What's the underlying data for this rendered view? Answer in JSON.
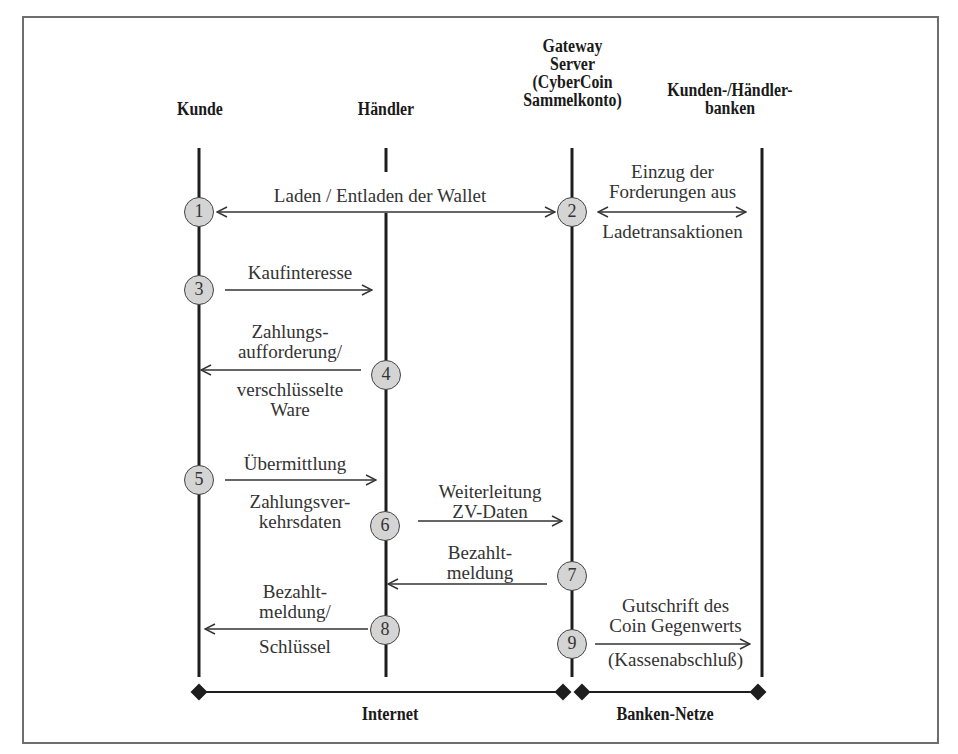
{
  "diagram": {
    "participants": [
      {
        "id": "kunde",
        "label": "Kunde"
      },
      {
        "id": "haendler",
        "label": "Händler"
      },
      {
        "id": "gateway",
        "label": "Gateway\nServer\n(CyberCoin\nSammelkonto)"
      },
      {
        "id": "banken",
        "label": "Kunden-/Händler-\nbanken"
      }
    ],
    "steps": [
      {
        "n": "1",
        "from": "kunde",
        "to": "gateway",
        "direction": "both",
        "label": "Laden / Entladen der Wallet"
      },
      {
        "n": "2",
        "from": "gateway",
        "to": "banken",
        "direction": "both",
        "label_above": "Einzug der\nForderungen aus",
        "label_below": "Ladetransaktionen"
      },
      {
        "n": "3",
        "from": "kunde",
        "to": "haendler",
        "direction": "right",
        "label": "Kaufinteresse"
      },
      {
        "n": "4",
        "from": "haendler",
        "to": "kunde",
        "direction": "left",
        "label_above": "Zahlungs-\naufforderung/",
        "label_below": "verschlüsselte\nWare"
      },
      {
        "n": "5",
        "from": "kunde",
        "to": "haendler",
        "direction": "right",
        "label_above": "Übermittlung",
        "label_below": "Zahlungsver-\nkehrsdaten"
      },
      {
        "n": "6",
        "from": "haendler",
        "to": "gateway",
        "direction": "right",
        "label": "Weiterleitung\nZV-Daten"
      },
      {
        "n": "7",
        "from": "gateway",
        "to": "haendler",
        "direction": "left",
        "label": "Bezahlt-\nmeldung"
      },
      {
        "n": "8",
        "from": "haendler",
        "to": "kunde",
        "direction": "left",
        "label_above": "Bezahlt-\nmeldung/",
        "label_below": "Schlüssel"
      },
      {
        "n": "9",
        "from": "gateway",
        "to": "banken",
        "direction": "right",
        "label_above": "Gutschrift des\nCoin Gegenwerts",
        "label_below": "(Kassenabschluß)"
      }
    ],
    "networks": [
      {
        "label": "Internet",
        "from": "kunde",
        "to": "gateway"
      },
      {
        "label": "Banken-Netze",
        "from": "gateway",
        "to": "banken"
      }
    ]
  }
}
